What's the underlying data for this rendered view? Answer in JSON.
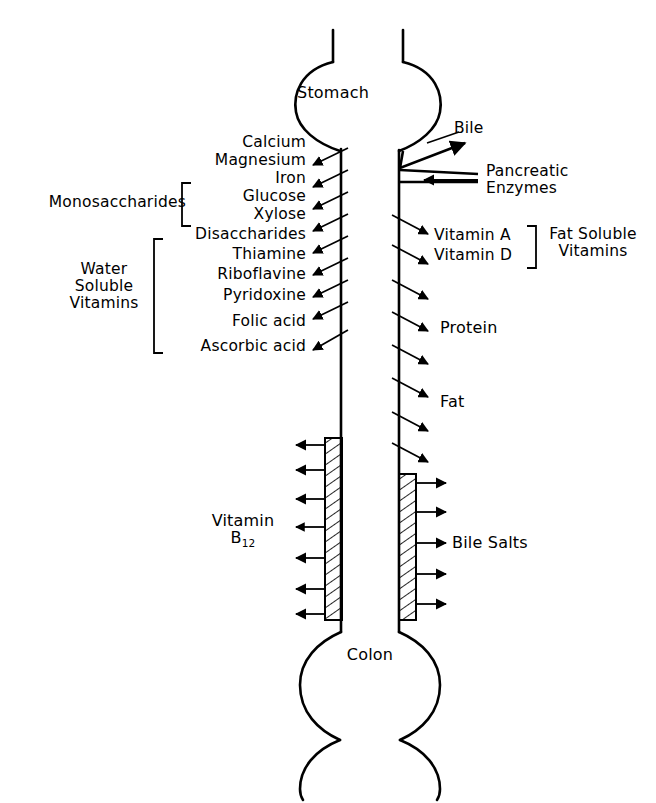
{
  "diagram": {
    "organs": {
      "stomach": "Stomach",
      "colon": "Colon"
    },
    "secretions": [
      {
        "name": "bile",
        "label": "Bile"
      },
      {
        "name": "pancreatic-enzymes",
        "label": "Pancreatic\nEnzymes",
        "line1": "Pancreatic",
        "line2": "Enzymes"
      }
    ],
    "left_absorbed": [
      "Calcium",
      "Magnesium",
      "Iron",
      "Glucose",
      "Xylose",
      "Disaccharides",
      "Thiamine",
      "Riboflavine",
      "Pyridoxine",
      "Folic acid",
      "Ascorbic acid"
    ],
    "left_groups": [
      {
        "name": "monosaccharides",
        "label": "Monosaccharides",
        "members": [
          "Glucose",
          "Xylose"
        ]
      },
      {
        "name": "water-soluble-vitamins",
        "label_lines": [
          "Water",
          "Soluble",
          "Vitamins"
        ],
        "members": [
          "Thiamine",
          "Riboflavine",
          "Pyridoxine",
          "Folic acid",
          "Ascorbic acid"
        ]
      }
    ],
    "right_secreted": [
      "Vitamin A",
      "Vitamin D",
      "Protein",
      "Fat"
    ],
    "right_groups": [
      {
        "name": "fat-soluble-vitamins",
        "label_lines": [
          "Fat Soluble",
          "Vitamins"
        ],
        "members": [
          "Vitamin A",
          "Vitamin D"
        ]
      }
    ],
    "ileum_left": {
      "name": "vitamin-b12",
      "line1": "Vitamin",
      "base": "B",
      "subscript": "12"
    },
    "ileum_right": {
      "name": "bile-salts",
      "label": "Bile Salts"
    },
    "arrow_counts": {
      "left_absorption_arrows": 9,
      "right_secretion_arrows": 7,
      "b12_arrows": 7,
      "bile_salts_arrows": 5
    },
    "colors": {
      "stroke": "#000000",
      "background": "#ffffff",
      "hatch": "#000000"
    }
  }
}
